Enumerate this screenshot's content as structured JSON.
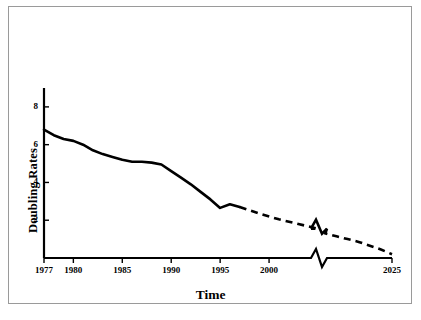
{
  "chart_data": {
    "type": "line",
    "title": "",
    "xlabel": "Time",
    "ylabel": "Doubling Rates",
    "xlim": [
      1977,
      2025
    ],
    "ylim": [
      0,
      9
    ],
    "grid": false,
    "legend": null,
    "axis_break": {
      "axis": "x",
      "at_year": 2005,
      "style": "zigzag"
    },
    "yticks": [
      2,
      4,
      6,
      8
    ],
    "ytick_labels": [
      "2",
      "4",
      "6",
      "8"
    ],
    "xticks": [
      1977,
      1980,
      1985,
      1990,
      1995,
      2000,
      2025
    ],
    "xtick_labels": [
      "1977",
      "1980",
      "1985",
      "1990",
      "1995",
      "2000",
      "2025"
    ],
    "series": [
      {
        "name": "Observed doubling rate",
        "style": "solid",
        "color": "#000000",
        "x": [
          1977,
          1978,
          1979,
          1980,
          1981,
          1982,
          1983,
          1984,
          1985,
          1986,
          1987,
          1988,
          1989,
          1990,
          1991,
          1992,
          1993,
          1994,
          1995,
          1996,
          1997
        ],
        "y": [
          6.8,
          6.5,
          6.3,
          6.2,
          6.0,
          5.7,
          5.5,
          5.35,
          5.2,
          5.1,
          5.1,
          5.05,
          4.95,
          4.6,
          4.25,
          3.9,
          3.5,
          3.1,
          2.65,
          2.85,
          2.7
        ]
      },
      {
        "name": "Projected doubling rate",
        "style": "dashed",
        "color": "#000000",
        "x": [
          1997,
          1999,
          2001,
          2003,
          2005,
          2007,
          2010,
          2013,
          2016,
          2019,
          2022,
          2025
        ],
        "y": [
          2.7,
          2.35,
          2.05,
          1.8,
          1.55,
          1.3,
          1.15,
          1.0,
          0.85,
          0.65,
          0.45,
          0.2
        ]
      }
    ]
  }
}
